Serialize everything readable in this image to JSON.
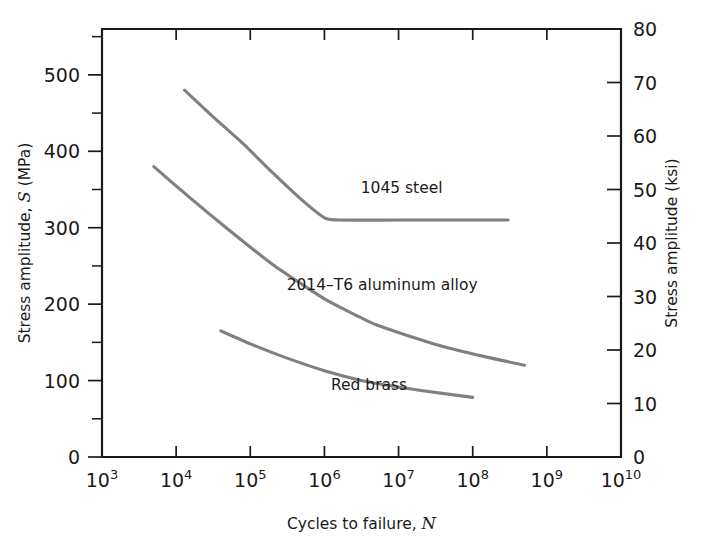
{
  "chart_data": {
    "type": "line",
    "title": "",
    "xlabel": "Cycles to failure, N",
    "xlabel_main": "Cycles to failure,",
    "xlabel_italic": "N",
    "ylabel": "Stress amplitude, S (MPa)",
    "ylabel_part1": "Stress amplitude,",
    "ylabel_italic": "S",
    "ylabel_part2": "(MPa)",
    "ylabel_right": "Stress amplitude (ksi)",
    "xscale": "log",
    "yscale": "linear",
    "xlim": [
      1000,
      10000000000
    ],
    "ylim": [
      0,
      560
    ],
    "ylim_right": [
      0,
      80
    ],
    "grid": false,
    "legend": "inline-annotations",
    "x_tick_labels": [
      "10³",
      "10⁴",
      "10⁵",
      "10⁶",
      "10⁷",
      "10⁸",
      "10⁹",
      "10¹⁰"
    ],
    "x_tick_bases": [
      "10",
      "10",
      "10",
      "10",
      "10",
      "10",
      "10",
      "10"
    ],
    "x_tick_exponents": [
      "3",
      "4",
      "5",
      "6",
      "7",
      "8",
      "9",
      "10"
    ],
    "x_tick_values": [
      1000,
      10000,
      100000,
      1000000,
      10000000,
      100000000,
      1000000000,
      10000000000
    ],
    "y_tick_labels": [
      "0",
      "100",
      "200",
      "300",
      "400",
      "500"
    ],
    "y_tick_values": [
      0,
      100,
      200,
      300,
      400,
      500
    ],
    "y_minor_tick_values": [
      50,
      150,
      250,
      350,
      450,
      550
    ],
    "y_right_tick_labels": [
      "0",
      "10",
      "20",
      "30",
      "40",
      "50",
      "60",
      "70",
      "80"
    ],
    "y_right_tick_values": [
      0,
      10,
      20,
      30,
      40,
      50,
      60,
      70,
      80
    ],
    "series": [
      {
        "name": "1045 steel",
        "label": "1045 steel",
        "color": "#808080",
        "label_x": 11000000.0,
        "label_y": 345,
        "has_fatigue_limit": true,
        "fatigue_limit_mpa": 310,
        "points": [
          {
            "x": 13000,
            "y": 480
          },
          {
            "x": 30000,
            "y": 447
          },
          {
            "x": 80000,
            "y": 410
          },
          {
            "x": 200000,
            "y": 372
          },
          {
            "x": 500000,
            "y": 336
          },
          {
            "x": 1000000,
            "y": 313
          },
          {
            "x": 1600000,
            "y": 310
          },
          {
            "x": 10000000,
            "y": 310
          },
          {
            "x": 100000000,
            "y": 310
          },
          {
            "x": 300000000,
            "y": 310
          }
        ]
      },
      {
        "name": "2014-T6 aluminum alloy",
        "label": "2014–T6 aluminum alloy",
        "color": "#808080",
        "label_x": 6000000.0,
        "label_y": 218,
        "has_fatigue_limit": false,
        "points": [
          {
            "x": 5000,
            "y": 380
          },
          {
            "x": 15000,
            "y": 340
          },
          {
            "x": 50000,
            "y": 298
          },
          {
            "x": 200000,
            "y": 252
          },
          {
            "x": 1000000,
            "y": 207
          },
          {
            "x": 5000000,
            "y": 173
          },
          {
            "x": 30000000,
            "y": 148
          },
          {
            "x": 150000000,
            "y": 131
          },
          {
            "x": 500000000,
            "y": 120
          }
        ]
      },
      {
        "name": "Red brass",
        "label": "Red brass",
        "color": "#808080",
        "label_x": 4000000.0,
        "label_y": 88,
        "has_fatigue_limit": false,
        "points": [
          {
            "x": 40000,
            "y": 165
          },
          {
            "x": 100000,
            "y": 148
          },
          {
            "x": 300000,
            "y": 130
          },
          {
            "x": 1000000,
            "y": 113
          },
          {
            "x": 4000000,
            "y": 98
          },
          {
            "x": 20000000,
            "y": 87
          },
          {
            "x": 100000000,
            "y": 78
          }
        ]
      }
    ]
  },
  "colors": {
    "axis": "#1a1a1a",
    "curve": "#808080",
    "background": "#ffffff"
  }
}
